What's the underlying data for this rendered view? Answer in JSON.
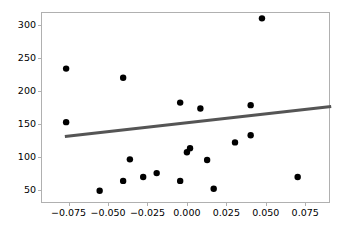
{
  "chart_data": {
    "type": "scatter",
    "title": "",
    "xlabel": "",
    "ylabel": "",
    "xlim": [
      -0.0925,
      0.0907
    ],
    "ylim": [
      29.7,
      319.2
    ],
    "grid": false,
    "legend": null,
    "xticks": [
      -0.075,
      -0.05,
      -0.025,
      0.0,
      0.025,
      0.05,
      0.075
    ],
    "xticklabels": [
      "−0.075",
      "−0.050",
      "−0.025",
      "0.000",
      "0.025",
      "0.050",
      "0.075"
    ],
    "yticks": [
      50,
      100,
      150,
      200,
      250,
      300
    ],
    "yticklabels": [
      "50",
      "100",
      "150",
      "200",
      "250",
      "300"
    ],
    "series": [
      {
        "name": "points",
        "marker": "circle",
        "color": "#000000",
        "size": 5,
        "points": [
          {
            "x": -0.0771,
            "y": 234
          },
          {
            "x": -0.0771,
            "y": 152
          },
          {
            "x": -0.0407,
            "y": 220
          },
          {
            "x": -0.0557,
            "y": 47
          },
          {
            "x": -0.0407,
            "y": 62
          },
          {
            "x": -0.0279,
            "y": 68
          },
          {
            "x": -0.0193,
            "y": 74
          },
          {
            "x": -0.0364,
            "y": 95
          },
          {
            "x": -0.0043,
            "y": 182
          },
          {
            "x": -0.0043,
            "y": 62
          },
          {
            "x": 0.0,
            "y": 106
          },
          {
            "x": 0.002,
            "y": 112
          },
          {
            "x": 0.0086,
            "y": 173
          },
          {
            "x": 0.0129,
            "y": 94
          },
          {
            "x": 0.0171,
            "y": 50
          },
          {
            "x": 0.0307,
            "y": 121
          },
          {
            "x": 0.0407,
            "y": 178
          },
          {
            "x": 0.0407,
            "y": 132
          },
          {
            "x": 0.0479,
            "y": 311
          },
          {
            "x": 0.0707,
            "y": 68
          }
        ]
      }
    ],
    "trendline": {
      "name": "regression-line",
      "color": "#555555",
      "width": 3,
      "x_start": -0.0779,
      "y_start": 130,
      "x_end": 0.0921,
      "y_end": 176
    }
  }
}
